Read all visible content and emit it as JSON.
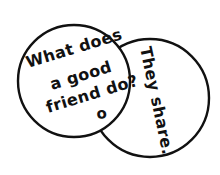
{
  "diagram": {
    "type": "two-overlapping-circles-handwritten-note",
    "background_color": "#ffffff",
    "stroke_color": "#111111",
    "text_color": "#111111",
    "left_circle": {
      "label": "question-circle",
      "center_x": 74,
      "center_y": 81,
      "radius": 56,
      "stroke_width": 2.4,
      "fill": "#ffffff",
      "lines": [
        {
          "text": "What does",
          "x": 28,
          "y": 68,
          "rotate": -17,
          "size": 16
        },
        {
          "text": "a good",
          "x": 52,
          "y": 90,
          "rotate": -17,
          "size": 16
        },
        {
          "text": "friend do?",
          "x": 48,
          "y": 113,
          "rotate": -17,
          "size": 16
        }
      ],
      "mark": {
        "text": "o",
        "x": 97,
        "y": 119,
        "size": 15,
        "rotate": -6
      }
    },
    "right_circle": {
      "label": "answer-circle",
      "center_x": 150,
      "center_y": 98,
      "radius": 59,
      "stroke_width": 2.4,
      "fill": "#ffffff",
      "lines": [
        {
          "text": "They share.",
          "x": 140,
          "y": 48,
          "rotate": 78,
          "size": 16
        }
      ]
    }
  }
}
